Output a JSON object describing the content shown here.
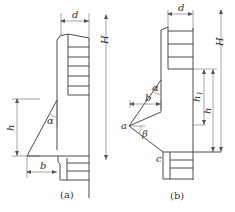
{
  "figure_a": {
    "caption": "(a)",
    "labels": {
      "d": "d",
      "H": "H",
      "h": "h",
      "alpha": "α",
      "b": "b"
    },
    "upper_steps": 6,
    "lower_steps": 3
  },
  "figure_b": {
    "caption": "(b)",
    "labels": {
      "d": "d",
      "H": "H",
      "h1_main": "h",
      "h1_sub": "1",
      "h": "h",
      "alpha": "α",
      "b": "b",
      "a": "a",
      "beta": "β",
      "c": "c"
    },
    "upper_steps": 4,
    "lower_steps": 3
  },
  "colors": {
    "line": "#4a4a4a",
    "text": "#333333",
    "background": "#ffffff"
  }
}
